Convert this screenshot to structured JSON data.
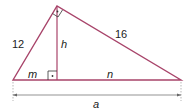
{
  "diagram": {
    "labels": {
      "left_leg": "12",
      "right_leg": "16",
      "altitude": "h",
      "left_segment": "m",
      "right_segment": "n",
      "hypotenuse": "a"
    },
    "colors": {
      "triangle_stroke": "#a8446a",
      "altitude_stroke": "#a8446a",
      "right_angle_marker": "#333333",
      "dimension_line": "#666666",
      "text": "#222222"
    }
  }
}
